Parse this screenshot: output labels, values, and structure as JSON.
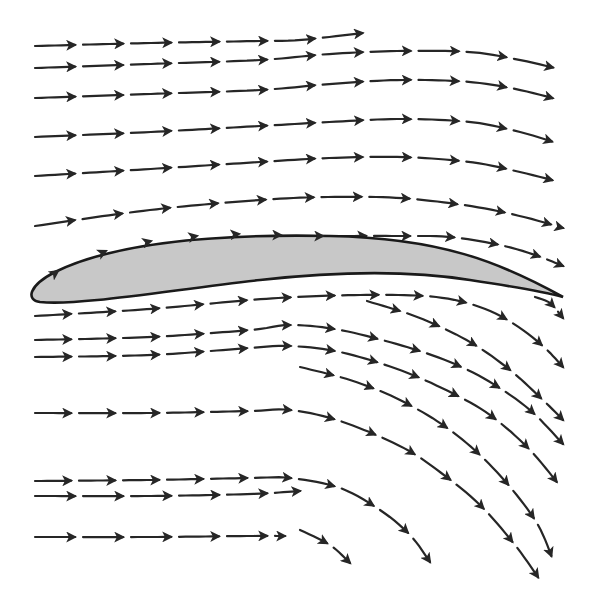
{
  "diagram": {
    "colors": {
      "background": "#ffffff",
      "airfoil_fill": "#c8c8c8",
      "airfoil_stroke": "#1a1a1a",
      "arrow": "#262626"
    },
    "airfoil": {
      "path": "M 563 297 C 500 262, 440 238, 330 236 C 230 234, 120 240, 55 272 C 28 286, 26 300, 40 302 C 80 306, 170 290, 260 280 C 350 270, 420 272, 470 280 C 510 286, 545 292, 563 297 Z",
      "surface_arrows": [
        [
          48,
          278,
          58,
          271
        ],
        [
          95,
          256,
          106,
          251
        ],
        [
          140,
          244,
          151,
          241
        ],
        [
          186,
          238,
          197,
          236
        ],
        [
          228,
          235,
          239,
          234
        ],
        [
          270,
          235,
          281,
          235
        ],
        [
          312,
          236,
          323,
          236
        ]
      ]
    },
    "streamlines": [
      {
        "id": "upper-1",
        "points": [
          [
            35,
            46
          ],
          [
            150,
            43
          ],
          [
            260,
            41
          ],
          [
            300,
            40
          ],
          [
            363,
            33
          ]
        ],
        "dash": 40,
        "gap": 8
      },
      {
        "id": "upper-2",
        "points": [
          [
            35,
            68
          ],
          [
            150,
            64
          ],
          [
            260,
            60
          ],
          [
            330,
            54
          ],
          [
            400,
            51
          ],
          [
            470,
            52
          ],
          [
            520,
            60
          ],
          [
            563,
            70
          ]
        ],
        "dash": 40,
        "gap": 8
      },
      {
        "id": "upper-3",
        "points": [
          [
            35,
            98
          ],
          [
            150,
            94
          ],
          [
            260,
            90
          ],
          [
            330,
            84
          ],
          [
            400,
            80
          ],
          [
            470,
            82
          ],
          [
            520,
            90
          ],
          [
            563,
            101
          ]
        ],
        "dash": 40,
        "gap": 8
      },
      {
        "id": "upper-4",
        "points": [
          [
            35,
            137
          ],
          [
            150,
            132
          ],
          [
            260,
            126
          ],
          [
            330,
            122
          ],
          [
            400,
            119
          ],
          [
            470,
            122
          ],
          [
            520,
            132
          ],
          [
            563,
            145
          ]
        ],
        "dash": 40,
        "gap": 8
      },
      {
        "id": "upper-5",
        "points": [
          [
            35,
            176
          ],
          [
            150,
            169
          ],
          [
            260,
            162
          ],
          [
            330,
            158
          ],
          [
            400,
            157
          ],
          [
            470,
            162
          ],
          [
            520,
            172
          ],
          [
            563,
            183
          ]
        ],
        "dash": 40,
        "gap": 8
      },
      {
        "id": "upper-6",
        "points": [
          [
            35,
            226
          ],
          [
            150,
            210
          ],
          [
            260,
            200
          ],
          [
            330,
            197
          ],
          [
            400,
            198
          ],
          [
            470,
            206
          ],
          [
            520,
            216
          ],
          [
            563,
            228
          ]
        ],
        "dash": 40,
        "gap": 8
      },
      {
        "id": "upper-7",
        "points": [
          [
            330,
            236
          ],
          [
            400,
            236
          ],
          [
            450,
            237
          ],
          [
            500,
            245
          ],
          [
            535,
            255
          ],
          [
            563,
            266
          ]
        ],
        "dash": 36,
        "gap": 8
      },
      {
        "id": "lower-1",
        "points": [
          [
            35,
            316
          ],
          [
            150,
            309
          ],
          [
            250,
            300
          ],
          [
            320,
            296
          ],
          [
            400,
            295
          ],
          [
            450,
            299
          ],
          [
            490,
            311
          ],
          [
            520,
            328
          ],
          [
            545,
            348
          ],
          [
            563,
            367
          ]
        ],
        "dash": 36,
        "gap": 8
      },
      {
        "id": "lower-2",
        "points": [
          [
            35,
            340
          ],
          [
            150,
            337
          ],
          [
            250,
            330
          ],
          [
            290,
            325
          ],
          [
            340,
            330
          ],
          [
            400,
            345
          ],
          [
            450,
            362
          ],
          [
            490,
            382
          ],
          [
            530,
            410
          ],
          [
            563,
            444
          ]
        ],
        "dash": 36,
        "gap": 8
      },
      {
        "id": "lower-3",
        "points": [
          [
            35,
            357
          ],
          [
            150,
            355
          ],
          [
            250,
            348
          ],
          [
            290,
            346
          ],
          [
            340,
            352
          ],
          [
            400,
            370
          ],
          [
            450,
            392
          ],
          [
            490,
            415
          ],
          [
            530,
            450
          ],
          [
            563,
            490
          ]
        ],
        "dash": 36,
        "gap": 8
      },
      {
        "id": "lower-4",
        "points": [
          [
            35,
            413
          ],
          [
            150,
            413
          ],
          [
            250,
            411
          ],
          [
            290,
            410
          ],
          [
            340,
            421
          ],
          [
            400,
            446
          ],
          [
            440,
            472
          ],
          [
            480,
            505
          ],
          [
            515,
            545
          ],
          [
            540,
            580
          ]
        ],
        "dash": 36,
        "gap": 8
      },
      {
        "id": "lower-5",
        "points": [
          [
            35,
            481
          ],
          [
            150,
            480
          ],
          [
            250,
            478
          ],
          [
            290,
            478
          ],
          [
            340,
            488
          ],
          [
            380,
            510
          ],
          [
            410,
            535
          ],
          [
            430,
            562
          ]
        ],
        "dash": 36,
        "gap": 8
      },
      {
        "id": "lower-6",
        "points": [
          [
            35,
            496
          ],
          [
            150,
            496
          ],
          [
            250,
            494
          ],
          [
            300,
            491
          ]
        ],
        "dash": 40,
        "gap": 8
      },
      {
        "id": "lower-7",
        "points": [
          [
            35,
            537
          ],
          [
            150,
            537
          ],
          [
            250,
            536
          ],
          [
            285,
            536
          ]
        ],
        "dash": 40,
        "gap": 8
      },
      {
        "id": "lower-8",
        "points": [
          [
            300,
            530
          ],
          [
            330,
            545
          ],
          [
            350,
            563
          ]
        ],
        "dash": 30,
        "gap": 8
      },
      {
        "id": "right-1",
        "points": [
          [
            367,
            301
          ],
          [
            420,
            318
          ],
          [
            470,
            342
          ],
          [
            510,
            370
          ],
          [
            545,
            402
          ],
          [
            563,
            420
          ]
        ],
        "dash": 34,
        "gap": 8
      },
      {
        "id": "right-2",
        "points": [
          [
            535,
            297
          ],
          [
            550,
            303
          ],
          [
            563,
            318
          ]
        ],
        "dash": 22,
        "gap": 6
      },
      {
        "id": "right-3",
        "points": [
          [
            300,
            367
          ],
          [
            350,
            380
          ],
          [
            400,
            400
          ],
          [
            450,
            430
          ],
          [
            495,
            470
          ],
          [
            535,
            520
          ],
          [
            553,
            560
          ]
        ],
        "dash": 34,
        "gap": 8
      }
    ]
  }
}
